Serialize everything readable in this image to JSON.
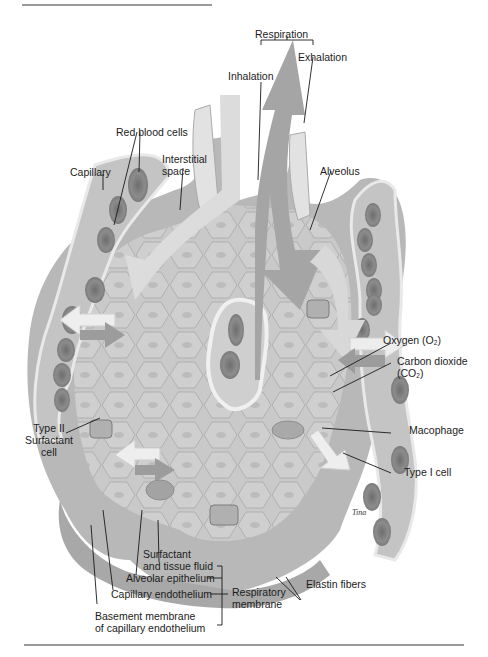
{
  "figure": {
    "colors": {
      "background": "#ffffff",
      "tissue_light": "#d9d9d9",
      "tissue_mid": "#bdbdbd",
      "tissue_dark": "#9e9e9e",
      "rbc": "#8a8a8a",
      "rbc_core": "#707070",
      "air_arrow": "#a9a9a9",
      "air_arrow_light": "#e6e6e6",
      "leader_line": "#1a1a1a",
      "rule": "#9a9a9a"
    },
    "signature": "Tina"
  },
  "labels": {
    "respiration": "Respiration",
    "inhalation": "Inhalation",
    "exhalation": "Exhalation",
    "red_blood_cells": "Red blood cells",
    "capillary": "Capillary",
    "interstitial_space_line1": "Interstitial",
    "interstitial_space_line2": "space",
    "alveolus": "Alveolus",
    "oxygen": "Oxygen (O",
    "oxygen_sub": "2",
    "oxygen_close": ")",
    "carbon_dioxide_line1": "Carbon dioxide",
    "carbon_dioxide_line2": "(CO",
    "carbon_dioxide_sub": "2",
    "carbon_dioxide_close": ")",
    "macrophage": "Macophage",
    "type_i_cell": "Type I cell",
    "type_ii_line1": "Type II",
    "type_ii_line2": "Surfactant",
    "type_ii_line3": "cell",
    "surfactant_line1": "Surfactant",
    "surfactant_line2": "and tissue  fluid",
    "alveolar_epithelium": "Alveolar epithelium",
    "capillary_endothelium": "Capillary  endothelium",
    "basement_line1": "Basement membrane",
    "basement_line2": "of capillary endothelium",
    "respiratory_membrane_line1": "Respiratory",
    "respiratory_membrane_line2": "membrane",
    "elastin_fibers": "Elastin fibers"
  }
}
